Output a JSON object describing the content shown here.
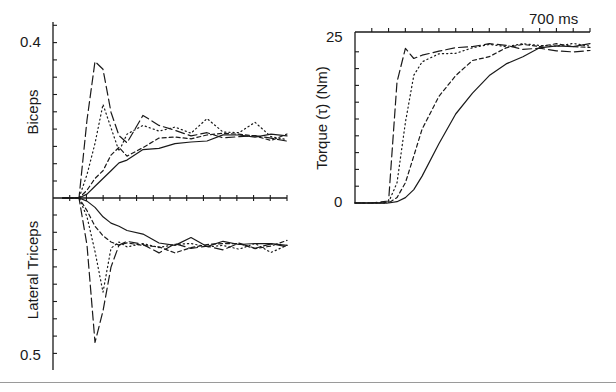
{
  "chart_data": [
    {
      "type": "line",
      "panel": "left-top",
      "title": "",
      "ylabel": "Biceps",
      "xlabel": "",
      "ytick_labels": [
        "0.4"
      ],
      "ylim": [
        0,
        0.4
      ],
      "xlim_ms": [
        0,
        700
      ],
      "x_ticks_count": 14,
      "grid": false,
      "legend": null,
      "series_styles": [
        "long-dash",
        "dotted",
        "short-dash",
        "solid"
      ],
      "x_ms": [
        0,
        50,
        75,
        100,
        125,
        150,
        175,
        200,
        250,
        300,
        350,
        400,
        450,
        500,
        550,
        600,
        650,
        700
      ],
      "series": [
        {
          "name": "long-dash (fastest)",
          "values": [
            0,
            0,
            0.2,
            0.35,
            0.33,
            0.22,
            0.16,
            0.14,
            0.21,
            0.19,
            0.17,
            0.16,
            0.17,
            0.15,
            0.16,
            0.16,
            0.15,
            0.15
          ]
        },
        {
          "name": "dotted",
          "values": [
            0,
            0,
            0.06,
            0.14,
            0.24,
            0.18,
            0.12,
            0.16,
            0.19,
            0.17,
            0.18,
            0.17,
            0.2,
            0.17,
            0.17,
            0.19,
            0.16,
            0.15
          ]
        },
        {
          "name": "short-dash",
          "values": [
            0,
            0,
            0.02,
            0.05,
            0.07,
            0.11,
            0.13,
            0.11,
            0.13,
            0.15,
            0.16,
            0.15,
            0.16,
            0.17,
            0.16,
            0.16,
            0.15,
            0.16
          ]
        },
        {
          "name": "solid (slowest)",
          "values": [
            0,
            0,
            0.01,
            0.03,
            0.05,
            0.07,
            0.09,
            0.1,
            0.12,
            0.13,
            0.14,
            0.14,
            0.15,
            0.16,
            0.16,
            0.16,
            0.16,
            0.16
          ]
        }
      ]
    },
    {
      "type": "line",
      "panel": "left-bottom",
      "title": "",
      "ylabel": "Lateral Triceps",
      "xlabel": "",
      "ytick_labels": [
        "0.5"
      ],
      "ylim": [
        0,
        0.5
      ],
      "y_direction": "inverted (increases downward)",
      "xlim_ms": [
        0,
        700
      ],
      "grid": false,
      "legend": null,
      "series_styles": [
        "long-dash",
        "dotted",
        "short-dash",
        "solid"
      ],
      "x_ms": [
        0,
        50,
        75,
        100,
        125,
        150,
        175,
        200,
        250,
        300,
        350,
        400,
        450,
        500,
        550,
        600,
        650,
        700
      ],
      "series": [
        {
          "name": "long-dash (fastest)",
          "values": [
            0,
            0,
            0.15,
            0.46,
            0.36,
            0.22,
            0.15,
            0.14,
            0.15,
            0.17,
            0.15,
            0.16,
            0.15,
            0.17,
            0.14,
            0.16,
            0.15,
            0.15
          ]
        },
        {
          "name": "dotted",
          "values": [
            0,
            0,
            0.06,
            0.17,
            0.3,
            0.16,
            0.14,
            0.16,
            0.14,
            0.16,
            0.15,
            0.14,
            0.16,
            0.15,
            0.16,
            0.15,
            0.17,
            0.15
          ]
        },
        {
          "name": "short-dash",
          "values": [
            0,
            0,
            0.04,
            0.09,
            0.12,
            0.14,
            0.15,
            0.14,
            0.15,
            0.16,
            0.17,
            0.16,
            0.15,
            0.14,
            0.15,
            0.16,
            0.15,
            0.14
          ]
        },
        {
          "name": "solid (slowest)",
          "values": [
            0,
            0,
            0.01,
            0.03,
            0.06,
            0.08,
            0.09,
            0.1,
            0.12,
            0.14,
            0.15,
            0.13,
            0.15,
            0.14,
            0.15,
            0.14,
            0.15,
            0.15
          ]
        }
      ]
    },
    {
      "type": "line",
      "panel": "right",
      "title": "",
      "ylabel": "Torque (τ) (Nm)",
      "xlabel": "700 ms",
      "ytick_labels": [
        "25",
        "0"
      ],
      "ylim": [
        0,
        25
      ],
      "xlim_ms": [
        0,
        700
      ],
      "x_ticks_count": 14,
      "grid": false,
      "legend": null,
      "series_styles": [
        "long-dash",
        "dotted",
        "short-dash",
        "solid"
      ],
      "x_ms": [
        0,
        50,
        100,
        125,
        150,
        175,
        200,
        250,
        300,
        350,
        400,
        450,
        500,
        550,
        600,
        650,
        700
      ],
      "series": [
        {
          "name": "long-dash (fastest)",
          "values": [
            0,
            0,
            0.3,
            18,
            23,
            21.5,
            22,
            22.5,
            23,
            23.5,
            23.5,
            23.5,
            23,
            22.8,
            22.8,
            22.5,
            22.5
          ]
        },
        {
          "name": "dotted",
          "values": [
            0,
            0,
            0.1,
            3,
            12,
            19,
            21,
            22,
            22.5,
            23,
            23.5,
            23.5,
            23.5,
            23.5,
            23.5,
            23.5,
            23.5
          ]
        },
        {
          "name": "short-dash",
          "values": [
            0,
            0,
            0,
            0.8,
            3,
            7,
            11,
            16,
            19,
            21,
            22,
            23,
            23.5,
            23.5,
            23.5,
            23.3,
            23.3
          ]
        },
        {
          "name": "solid (slowest)",
          "values": [
            0,
            0,
            0,
            0.2,
            0.8,
            2,
            4,
            9,
            13,
            16.5,
            19,
            20.5,
            22,
            23,
            23.3,
            23.5,
            23.5
          ]
        }
      ]
    }
  ],
  "figure": {
    "left_panel": {
      "top_ylabel": "Biceps",
      "bottom_ylabel": "Lateral Triceps",
      "top_tick": "0.4",
      "bottom_tick": "0.5"
    },
    "right_panel": {
      "ylabel": "Torque (τ) (Nm)",
      "ytick_top": "25",
      "ytick_bottom": "0",
      "time_label": "700 ms"
    }
  }
}
